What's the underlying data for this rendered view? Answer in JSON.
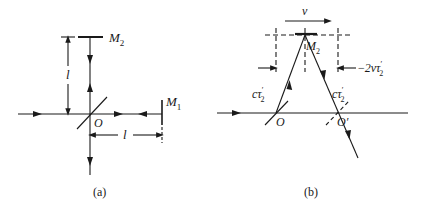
{
  "figure": {
    "type": "Michelson interferometer schematic",
    "panel_a": {
      "caption": "(a)",
      "labels": {
        "mirror_top": "M",
        "mirror_top_sub": "2",
        "mirror_right": "M",
        "mirror_right_sub": "1",
        "origin": "O",
        "vertical_length": "l",
        "horizontal_length": "l"
      }
    },
    "panel_b": {
      "caption": "(b)",
      "labels": {
        "velocity": "v",
        "mirror_top": "M",
        "mirror_top_sub": "2",
        "origin": "O",
        "origin_prime": "O′",
        "left_leg": "cτ",
        "left_leg_sub": "2",
        "left_leg_prime": "′",
        "right_leg": "cτ",
        "right_leg_sub": "2",
        "right_leg_prime": "′",
        "displacement": "2vτ",
        "displacement_sub": "2",
        "displacement_prime": "′"
      }
    },
    "colors": {
      "ink": "#1a1a1a",
      "background": "#ffffff"
    }
  }
}
